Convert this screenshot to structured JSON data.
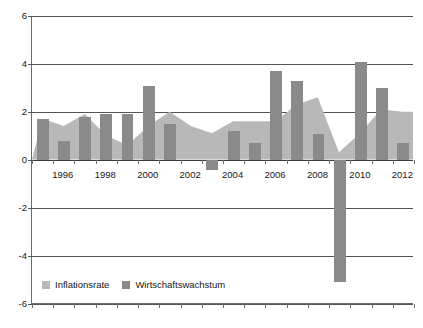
{
  "chart_data": {
    "type": "bar",
    "title": "",
    "subtitle": "",
    "xlabel": "",
    "ylabel": "",
    "ylim": [
      -6,
      6
    ],
    "ytick_values": [
      6,
      4,
      2,
      0,
      -2,
      -4,
      -6
    ],
    "ytick_labels": [
      "6",
      "4",
      "2",
      "0",
      "-2",
      "-4",
      "-6"
    ],
    "grid": true,
    "legend_position": "bottom-left",
    "categories": [
      1995,
      1996,
      1997,
      1998,
      1999,
      2000,
      2001,
      2002,
      2003,
      2004,
      2005,
      2006,
      2007,
      2008,
      2009,
      2010,
      2011,
      2012
    ],
    "xtick_labels": [
      "1996",
      "1998",
      "2000",
      "2002",
      "2004",
      "2006",
      "2008",
      "2010",
      "2012"
    ],
    "xtick_categories": [
      1996,
      1998,
      2000,
      2002,
      2004,
      2006,
      2008,
      2010,
      2012
    ],
    "series": [
      {
        "name": "Inflationsrate",
        "type": "area",
        "color": "#b8b8b8",
        "values": [
          1.7,
          1.4,
          1.9,
          1.0,
          0.6,
          1.4,
          2.0,
          1.4,
          1.1,
          1.6,
          1.6,
          1.6,
          2.3,
          2.6,
          0.3,
          1.1,
          2.1,
          2.0
        ]
      },
      {
        "name": "Wirtschaftswachstum",
        "type": "bar",
        "color": "#8a8a8a",
        "values": [
          1.7,
          0.8,
          1.8,
          1.9,
          1.9,
          3.1,
          1.5,
          0.0,
          -0.4,
          1.2,
          0.7,
          3.7,
          3.3,
          1.1,
          -5.1,
          4.1,
          3.0,
          0.7
        ]
      }
    ]
  },
  "legend": {
    "items": [
      {
        "label": "Inflationsrate",
        "color": "#b8b8b8"
      },
      {
        "label": "Wirtschaftswachstum",
        "color": "#8a8a8a"
      }
    ]
  }
}
